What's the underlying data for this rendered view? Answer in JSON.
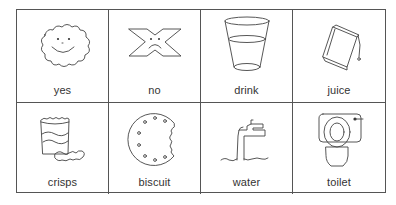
{
  "board": {
    "title": "",
    "cards": [
      {
        "label": "yes",
        "icon": "smiling-cloud-icon"
      },
      {
        "label": "no",
        "icon": "sad-cross-icon"
      },
      {
        "label": "drink",
        "icon": "glass-icon"
      },
      {
        "label": "juice",
        "icon": "juice-carton-icon"
      },
      {
        "label": "crisps",
        "icon": "crisps-packet-icon"
      },
      {
        "label": "biscuit",
        "icon": "bitten-biscuit-icon"
      },
      {
        "label": "water",
        "icon": "tap-icon"
      },
      {
        "label": "toilet",
        "icon": "toilet-icon"
      }
    ]
  },
  "colors": {
    "line": "#555555",
    "text": "#333333",
    "background": "#ffffff"
  }
}
